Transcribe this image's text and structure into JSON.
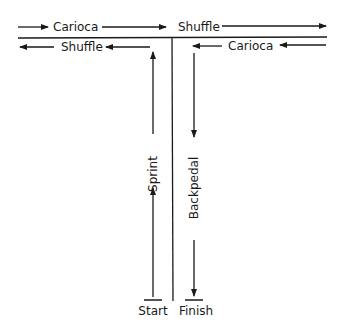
{
  "diagram": {
    "type": "agility drill route (T-drill)",
    "colors": {
      "line": "#1a1a1a",
      "background": "#ffffff"
    },
    "top_row": {
      "segment_1": {
        "label": "Carioca",
        "direction": "right"
      },
      "segment_2": {
        "label": "Shuffle",
        "direction": "right"
      }
    },
    "second_row": {
      "segment_1": {
        "label": "Shuffle",
        "direction": "left"
      },
      "segment_2": {
        "label": "Carioca",
        "direction": "left"
      }
    },
    "left_stem": {
      "label": "Sprint",
      "direction": "up"
    },
    "right_stem": {
      "label": "Backpedal",
      "direction": "down"
    },
    "start_label": "Start",
    "finish_label": "Finish"
  }
}
